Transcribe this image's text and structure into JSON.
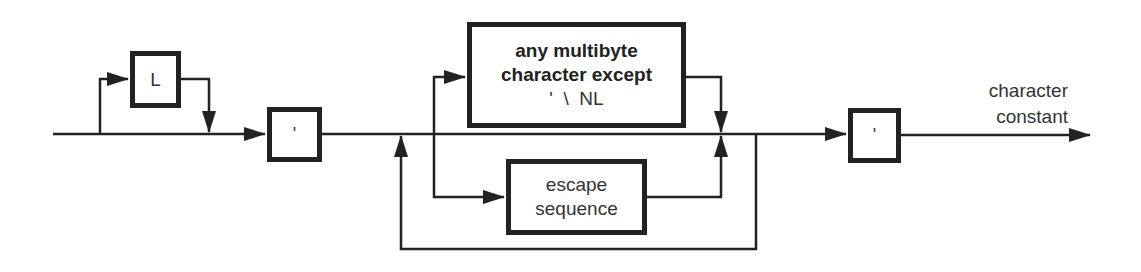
{
  "diagram": {
    "type": "syntax-diagram",
    "title": "character constant",
    "nodes": {
      "prefix_L": {
        "label": "L",
        "optional": true
      },
      "open_quote": {
        "label": "'"
      },
      "multibyte": {
        "line1": "any multibyte",
        "line2": "character except",
        "line3": "'  \\  NL"
      },
      "escape": {
        "line1": "escape",
        "line2": "sequence"
      },
      "close_quote": {
        "label": "'"
      }
    },
    "output_label": {
      "line1": "character",
      "line2": "constant"
    },
    "colors": {
      "line": "#222222",
      "text": "#333333",
      "background": "#ffffff"
    }
  }
}
